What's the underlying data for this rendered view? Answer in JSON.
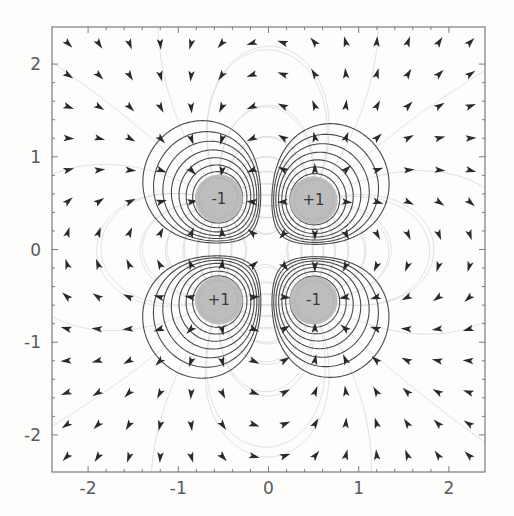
{
  "figure": {
    "name": "electric-quadrupole-field-plot",
    "background_color": "#fdfdfc",
    "frame": {
      "left": 52,
      "top": 27,
      "right": 485,
      "bottom": 472,
      "color": "#6f6f6f"
    }
  },
  "chart_data": {
    "type": "scatter",
    "title": "",
    "subtitle": "",
    "xlabel": "",
    "ylabel": "",
    "xlim": [
      -2.4,
      2.4
    ],
    "ylim": [
      -2.4,
      2.4
    ],
    "grid": false,
    "legend": "none",
    "x_ticks": [
      -2,
      -1,
      0,
      1,
      2
    ],
    "y_ticks": [
      -2,
      -1,
      0,
      1,
      2
    ],
    "x_tick_labels": [
      "-2",
      "-1",
      "0",
      "1",
      "2"
    ],
    "y_tick_labels": [
      "-2",
      "-1",
      "0",
      "1",
      "2"
    ],
    "minor_ticks_per_interval": 4,
    "charges": [
      {
        "name": "charge-top-left",
        "label": "-1",
        "sign": -1,
        "x": -0.55,
        "y": 0.55,
        "radius_px": 24,
        "disk_color": "#b9b9b9"
      },
      {
        "name": "charge-top-right",
        "label": "+1",
        "sign": 1,
        "x": 0.5,
        "y": 0.53,
        "radius_px": 24,
        "disk_color": "#b9b9b9"
      },
      {
        "name": "charge-bottom-left",
        "label": "+1",
        "sign": 1,
        "x": -0.55,
        "y": -0.55,
        "radius_px": 24,
        "disk_color": "#b9b9b9"
      },
      {
        "name": "charge-bottom-right",
        "label": "-1",
        "sign": -1,
        "x": 0.5,
        "y": -0.55,
        "radius_px": 24,
        "disk_color": "#b9b9b9"
      }
    ],
    "equipotential_contours": {
      "color": "#4a4a4a",
      "line_width": 1.1,
      "levels_per_charge": [
        0.42,
        0.56,
        0.74,
        0.98,
        1.3,
        1.75,
        2.4,
        3.4
      ],
      "description": "nested closed equipotential loops around each of the four point charges, merging into hyperbolic saddle structure at the origin"
    },
    "field_lines": {
      "color": "#d8d8d8",
      "line_width": 0.8,
      "description": "faint radial field streamlines emanating from each charge"
    },
    "arrows": {
      "color": "#2a2a2a",
      "count": 196,
      "size_px": 7,
      "description": "small filled triangular arrowheads sampled on a grid indicating local electric field direction"
    }
  }
}
